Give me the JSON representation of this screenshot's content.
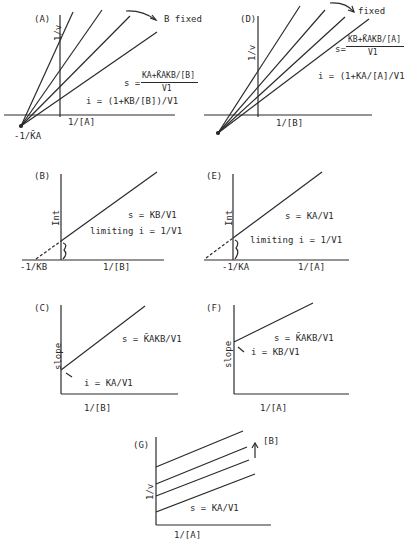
{
  "panels": {
    "A": {
      "label": "(A)",
      "y_axis": "1/v",
      "x_axis": "1/[A]",
      "intercept": "-1/K̄A",
      "annotation": "B fixed",
      "slope_eq_prefix": "s =",
      "slope_num": "KA+K̄AKB/[B]",
      "slope_den": "V1",
      "intercept_eq": "i = (1+KB/[B])/V1"
    },
    "D": {
      "label": "(D)",
      "y_axis": "1/v",
      "x_axis": "1/[B]",
      "annotation": "fixed",
      "slope_eq_prefix": "s=",
      "slope_num": "KB+K̄AKB/[A]",
      "slope_den": "V1",
      "intercept_eq": "i = (1+KA/[A]/V1"
    },
    "B": {
      "label": "(B)",
      "y_axis": "Int",
      "x_axis": "1/[B]",
      "intercept": "-1/KB",
      "slope_eq": "s = KB/V1",
      "limit_eq": "limiting i = 1/V1"
    },
    "E": {
      "label": "(E)",
      "y_axis": "Int",
      "x_axis": "1/[A]",
      "intercept": "-1/KA",
      "slope_eq": "s = KA/V1",
      "limit_eq": "limiting i = 1/V1"
    },
    "C": {
      "label": "(C)",
      "y_axis": "slope",
      "x_axis": "1/[B]",
      "slope_eq": "s = K̄AKB/V1",
      "intercept_eq": "i = KA/V1"
    },
    "F": {
      "label": "(F)",
      "y_axis": "slope",
      "x_axis": "1/[A]",
      "slope_eq": "s = K̄AKB/V1",
      "intercept_eq": "i = KB/V1"
    },
    "G": {
      "label": "(G)",
      "y_axis": "1/v",
      "x_axis": "1/[A]",
      "annotation": "[B]",
      "slope_eq": "s = KA/V1"
    }
  }
}
